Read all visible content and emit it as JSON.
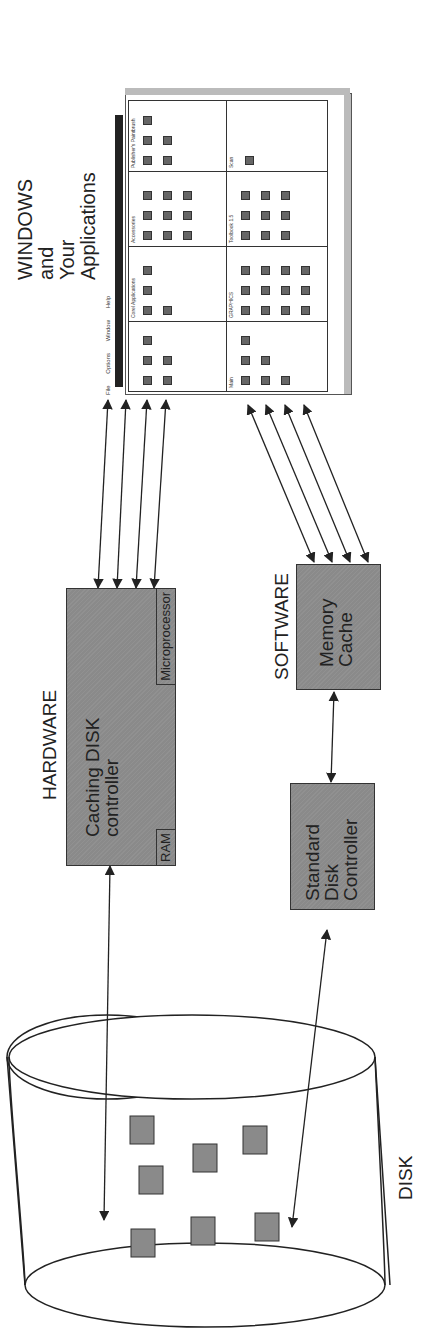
{
  "labels": {
    "windows_title": [
      "WINDOWS",
      "and",
      "Your",
      "Applications"
    ],
    "hardware": "HARDWARE",
    "software": "SOFTWARE",
    "disk": "DISK"
  },
  "boxes": {
    "caching_controller": {
      "lines": [
        "Caching  DISK",
        "controller"
      ],
      "sub_left": "RAM",
      "sub_right": "Microprocessor"
    },
    "memory_cache": {
      "lines": [
        "Memory",
        "Cache"
      ]
    },
    "standard_controller": {
      "lines": [
        "Standard",
        "Disk",
        "Controller"
      ]
    }
  },
  "windows_ui": {
    "menu": [
      "File",
      "Options",
      "Window",
      "Help"
    ],
    "groups": [
      "Main",
      "Corel Applications",
      "Accessories",
      "Publisher's Paintbrush",
      "GRAPHICS",
      "Toolbook 1.5",
      "Scan"
    ]
  },
  "colors": {
    "box_fill": "#8a8a8a",
    "line": "#333333"
  }
}
